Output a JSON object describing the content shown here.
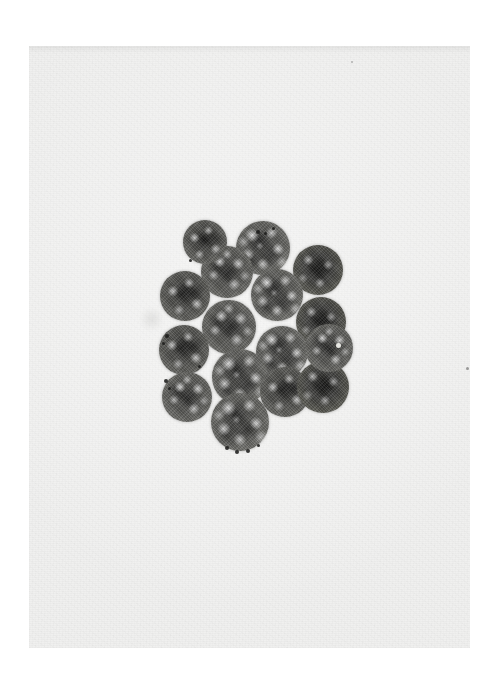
{
  "page": {
    "background_color": "#ffffff",
    "width": 499,
    "height": 694,
    "caption": ""
  },
  "plate": {
    "type": "photographic-print",
    "description": "Black-and-white light micrograph of a spherical colony of closely packed cells",
    "background_color": "#f0f0ef",
    "x": 29,
    "y": 46,
    "width": 441,
    "height": 602,
    "border": "none",
    "label": ""
  },
  "specimen": {
    "name": "cell-colony",
    "cell_count": 16,
    "arrangement": "hexagonally packed rosette, roughly circular outline",
    "cell_fill_dark": "#4a4a48",
    "cell_rim_light": "#f2f2ee",
    "cells": [
      {
        "id": "cell-01",
        "cx": 234,
        "cy": 202,
        "r": 27,
        "tone": "v1"
      },
      {
        "id": "cell-02",
        "cx": 289,
        "cy": 224,
        "r": 25,
        "tone": "dark"
      },
      {
        "id": "cell-03",
        "cx": 198,
        "cy": 226,
        "r": 26,
        "tone": "v2"
      },
      {
        "id": "cell-04",
        "cx": 156,
        "cy": 250,
        "r": 25,
        "tone": "v3"
      },
      {
        "id": "cell-05",
        "cx": 248,
        "cy": 249,
        "r": 26,
        "tone": "v1"
      },
      {
        "id": "cell-06",
        "cx": 292,
        "cy": 276,
        "r": 25,
        "tone": "dark"
      },
      {
        "id": "cell-07",
        "cx": 200,
        "cy": 281,
        "r": 27,
        "tone": "v2"
      },
      {
        "id": "cell-08",
        "cx": 253,
        "cy": 306,
        "r": 26,
        "tone": "v1"
      },
      {
        "id": "cell-09",
        "cx": 155,
        "cy": 304,
        "r": 25,
        "tone": "v3"
      },
      {
        "id": "cell-10",
        "cx": 211,
        "cy": 331,
        "r": 28,
        "tone": "v1"
      },
      {
        "id": "cell-11",
        "cx": 158,
        "cy": 351,
        "r": 25,
        "tone": "v2"
      },
      {
        "id": "cell-12",
        "cx": 256,
        "cy": 346,
        "r": 25,
        "tone": "v3"
      },
      {
        "id": "cell-13",
        "cx": 294,
        "cy": 341,
        "r": 26,
        "tone": "dark"
      },
      {
        "id": "cell-14",
        "cx": 211,
        "cy": 376,
        "r": 29,
        "tone": "v1"
      },
      {
        "id": "cell-15",
        "cx": 300,
        "cy": 302,
        "r": 24,
        "tone": "v2"
      },
      {
        "id": "cell-16",
        "cx": 176,
        "cy": 196,
        "r": 22,
        "tone": "v3"
      }
    ],
    "granules": [
      {
        "x": 227,
        "y": 184,
        "d": 4
      },
      {
        "x": 235,
        "y": 186,
        "d": 3
      },
      {
        "x": 243,
        "y": 181,
        "d": 3
      },
      {
        "x": 136,
        "y": 288,
        "d": 4
      },
      {
        "x": 133,
        "y": 296,
        "d": 3
      },
      {
        "x": 135,
        "y": 333,
        "d": 4
      },
      {
        "x": 139,
        "y": 341,
        "d": 3
      },
      {
        "x": 169,
        "y": 319,
        "d": 3
      },
      {
        "x": 196,
        "y": 400,
        "d": 4
      },
      {
        "x": 206,
        "y": 404,
        "d": 4
      },
      {
        "x": 217,
        "y": 403,
        "d": 4
      },
      {
        "x": 228,
        "y": 398,
        "d": 3
      },
      {
        "x": 160,
        "y": 213,
        "d": 3
      }
    ],
    "pyrenoid": {
      "x": 307,
      "y": 297,
      "d": 5
    }
  },
  "artifacts": {
    "smudge": {
      "x": 110,
      "y": 262,
      "w": 26,
      "h": 22,
      "label": "faint out-of-focus debris"
    },
    "speck_right": {
      "x": 437,
      "y": 321,
      "label": "dust speck on print"
    },
    "speck_upper": {
      "x": 322,
      "y": 15,
      "label": "faint dust speck"
    }
  },
  "colors": {
    "page": "#ffffff",
    "print_paper": "#f0f0ef",
    "cell_core": "#4a4a48",
    "cell_highlight": "#ffffff",
    "granule": "#1d1d1b"
  }
}
